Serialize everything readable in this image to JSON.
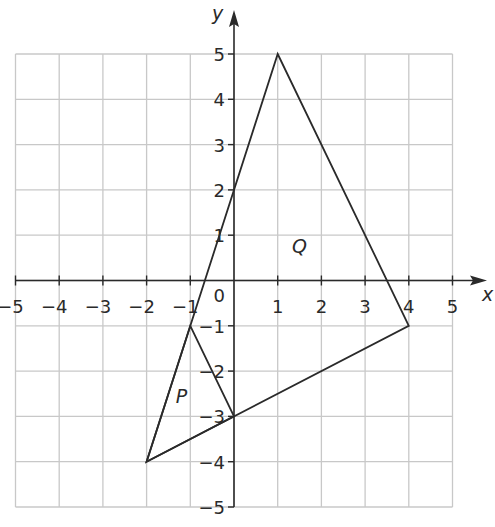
{
  "axes": {
    "x_label": "x",
    "y_label": "y",
    "x_range": [
      -5,
      5
    ],
    "y_range": [
      -5,
      5
    ],
    "x_ticks": [
      "−5",
      "−4",
      "−3",
      "−2",
      "−1",
      "1",
      "2",
      "3",
      "4",
      "5"
    ],
    "y_ticks": [
      "5",
      "4",
      "3",
      "2",
      "1",
      "−1",
      "−2",
      "−3",
      "−4",
      "−5"
    ],
    "origin_label": "0",
    "grid": true
  },
  "shapes": [
    {
      "name": "P",
      "label": "P",
      "vertices": [
        [
          -1,
          -1
        ],
        [
          0,
          -3
        ],
        [
          -2,
          -4
        ]
      ],
      "label_position": [
        -1.2,
        -2.7
      ]
    },
    {
      "name": "Q",
      "label": "Q",
      "vertices": [
        [
          1,
          5
        ],
        [
          4,
          -1
        ],
        [
          -2,
          -4
        ]
      ],
      "label_position": [
        1.5,
        0.6
      ]
    }
  ],
  "colors": {
    "grid": "#c8c8c8",
    "axes": "#2a2a2a",
    "shape_stroke": "#2a2a2a"
  }
}
